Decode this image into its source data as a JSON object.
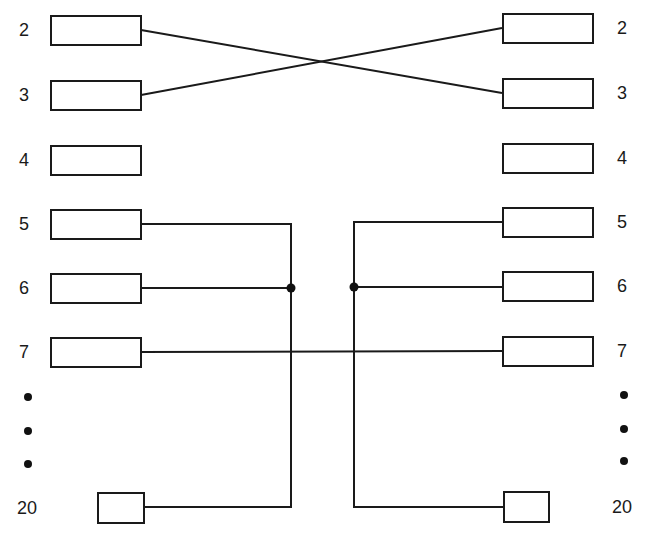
{
  "diagram": {
    "type": "pin-wiring",
    "description_visible": "Two connectors with pins 2-7 and 20; pins 2 and 3 crossed; pin 5, 6 and 20 joined on each side; pin 7 straight through",
    "left_connector": {
      "pins": [
        {
          "label": "2"
        },
        {
          "label": "3"
        },
        {
          "label": "4"
        },
        {
          "label": "5"
        },
        {
          "label": "6"
        },
        {
          "label": "7"
        },
        {
          "label": "20"
        }
      ],
      "ellipsis": [
        "•",
        "•",
        "•"
      ]
    },
    "right_connector": {
      "pins": [
        {
          "label": "2"
        },
        {
          "label": "3"
        },
        {
          "label": "4"
        },
        {
          "label": "5"
        },
        {
          "label": "6"
        },
        {
          "label": "7"
        },
        {
          "label": "20"
        }
      ],
      "ellipsis": [
        "•",
        "•",
        "•"
      ]
    },
    "connections": [
      {
        "from": "left.2",
        "to": "right.3",
        "style": "cross"
      },
      {
        "from": "left.3",
        "to": "right.2",
        "style": "cross"
      },
      {
        "from": "left.7",
        "to": "right.7",
        "style": "straight"
      },
      {
        "group": [
          "left.5",
          "left.6",
          "left.20"
        ],
        "junction": "left-bus"
      },
      {
        "group": [
          "right.5",
          "right.6",
          "right.20"
        ],
        "junction": "right-bus"
      }
    ],
    "colors": {
      "line": "#1a1a1a",
      "background": "#ffffff"
    }
  }
}
